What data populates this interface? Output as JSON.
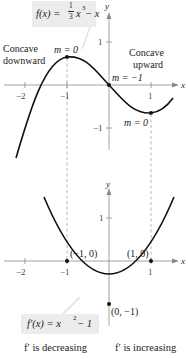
{
  "top_graph": {
    "function_label": "f(x) = 1/3 x^3 − x",
    "function_label_parts": {
      "fx": "f(x) = ",
      "num": "1",
      "den": "3",
      "rest_x": "x",
      "exp": "3",
      "tail": " − x"
    },
    "axis_x_label": "x",
    "axis_y_label": "y",
    "x_ticks": [
      "−2",
      "−1",
      "1"
    ],
    "y_ticks": [
      "1",
      "−1"
    ],
    "annotations": {
      "concave_down_line1": "Concave",
      "concave_down_line2": "downward",
      "concave_up_line1": "Concave",
      "concave_up_line2": "upward",
      "slope_max": "m = 0",
      "slope_inflection": "m = −1",
      "slope_min": "m = 0"
    }
  },
  "bottom_graph": {
    "function_label": "f′(x) = x^2 − 1",
    "function_label_parts": {
      "fx": "f′(x) = x",
      "exp": "2",
      "tail": " − 1"
    },
    "axis_x_label": "x",
    "axis_y_label": "y",
    "x_ticks": [
      "−2",
      "−1",
      "1"
    ],
    "y_ticks": [
      "1"
    ],
    "points": {
      "left_root": "(−1, 0)",
      "right_root": "(1, 0)",
      "vertex": "(0, −1)"
    }
  },
  "captions": {
    "left": "f′ is decreasing",
    "right": "f′ is increasing"
  },
  "colors": {
    "curve": "#111111",
    "axis": "#8a8a8a",
    "dashed": "#9a9a9a",
    "label_box": "#ececec"
  }
}
